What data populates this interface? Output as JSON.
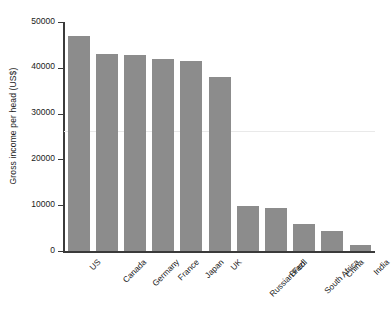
{
  "chart_data": {
    "type": "bar",
    "title": "",
    "xlabel": "",
    "ylabel": "Gross income per head (US$)",
    "categories": [
      "US",
      "Canada",
      "Germany",
      "France",
      "Japan",
      "UK",
      "Russian Fed.",
      "Brazil",
      "South Africa",
      "China",
      "India"
    ],
    "values": [
      47000,
      43000,
      42800,
      42000,
      41500,
      38000,
      9900,
      9400,
      5900,
      4300,
      1400
    ],
    "ylim": [
      0,
      50000
    ],
    "yticks": [
      0,
      10000,
      20000,
      30000,
      40000,
      50000
    ],
    "ytick_labels": [
      "0",
      "10000",
      "20000",
      "30000",
      "40000",
      "50000"
    ],
    "grid": false,
    "legend": null,
    "bar_color": "#8c8c8c",
    "reference_line": {
      "value": 26300,
      "color": "#e9e9e9"
    }
  }
}
